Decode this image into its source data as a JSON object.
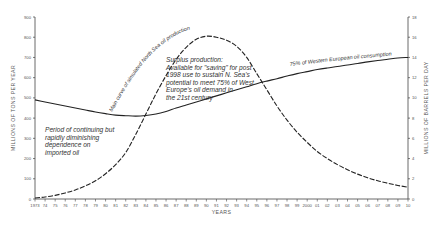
{
  "chart_data": {
    "type": "line",
    "title": "",
    "xlabel": "YEARS",
    "ylabel": "MILLIONS OF TONS PER YEAR",
    "y2label": "MILLIONS OF BARRELS PER DAY",
    "ylim": [
      0,
      900
    ],
    "y2lim": [
      0,
      18
    ],
    "grid": false,
    "x_ticks": [
      "1973",
      "74",
      "75",
      "76",
      "77",
      "78",
      "79",
      "80",
      "81",
      "82",
      "83",
      "84",
      "85",
      "86",
      "87",
      "88",
      "89",
      "90",
      "91",
      "92",
      "93",
      "94",
      "95",
      "96",
      "97",
      "98",
      "99",
      "2000",
      "01",
      "02",
      "03",
      "04",
      "05",
      "06",
      "07",
      "08",
      "09",
      "10"
    ],
    "y_ticks": [
      0,
      100,
      200,
      300,
      400,
      500,
      600,
      700,
      800,
      900
    ],
    "y2_ticks": [
      0,
      2,
      4,
      6,
      8,
      10,
      12,
      14,
      16,
      18
    ],
    "x": [
      1973,
      1974,
      1975,
      1976,
      1977,
      1978,
      1979,
      1980,
      1981,
      1982,
      1983,
      1984,
      1985,
      1986,
      1987,
      1988,
      1989,
      1990,
      1991,
      1992,
      1993,
      1994,
      1995,
      1996,
      1997,
      1998,
      1999,
      2000,
      2001,
      2002,
      2003,
      2004,
      2005,
      2006,
      2007,
      2008,
      2009,
      2010
    ],
    "series": [
      {
        "name": "Main curve of simulated North Sea oil production",
        "style": "dashed",
        "values": [
          5,
          10,
          18,
          30,
          45,
          65,
          90,
          125,
          170,
          230,
          320,
          420,
          520,
          610,
          690,
          750,
          790,
          805,
          800,
          785,
          755,
          700,
          620,
          540,
          460,
          390,
          330,
          280,
          235,
          200,
          170,
          145,
          123,
          105,
          90,
          78,
          67,
          58
        ]
      },
      {
        "name": "75% of Western European oil consumption",
        "style": "solid",
        "values": [
          490,
          480,
          470,
          460,
          450,
          440,
          430,
          422,
          415,
          412,
          410,
          413,
          420,
          433,
          450,
          465,
          480,
          495,
          510,
          525,
          540,
          555,
          570,
          583,
          595,
          608,
          620,
          630,
          640,
          648,
          655,
          663,
          670,
          678,
          685,
          691,
          697,
          700
        ]
      }
    ],
    "annotations": [
      "Period of continuing but rapidly diminishing dependence on imported oil",
      "Surplus production: Available for \"saving\" for post 1998 use to sustain N. Sea's potential to meet 75% of West Europe's oil demand in the 21st century"
    ]
  },
  "labels": {
    "x_title": "YEARS",
    "y_title": "MILLIONS OF TONS PER YEAR",
    "y2_title": "MILLIONS OF BARRELS PER DAY",
    "production_curve": "Main curve of simulated North Sea oil production",
    "consumption_curve": "75% of Western European oil consumption",
    "left_note": [
      "Period of continuing but",
      "rapidly diminishing",
      "dependence on",
      "imported oil"
    ],
    "surplus_note": [
      "Surplus production:",
      "Available for \"saving\" for post",
      "1998 use to sustain N. Sea's",
      "potential to meet 75% of West",
      "Europe's oil demand in",
      "the 21st century"
    ]
  }
}
